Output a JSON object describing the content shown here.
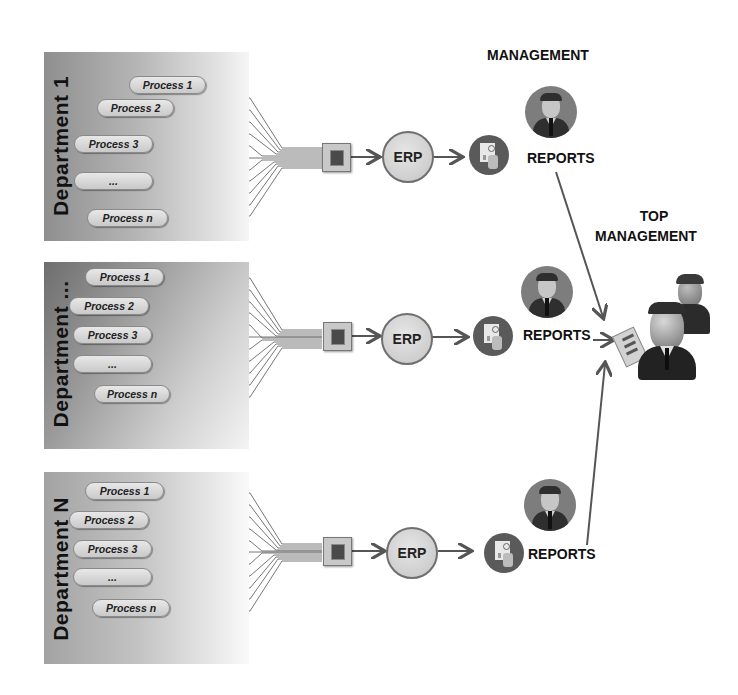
{
  "diagram": {
    "top_labels": {
      "management": "MANAGEMENT",
      "top_management_line1": "TOP",
      "top_management_line2": "MANAGEMENT"
    },
    "departments": [
      {
        "name": "Department  1",
        "processes": [
          "Process 1",
          "Process 2",
          "Process 3",
          "...",
          "Process n"
        ],
        "system": "ERP",
        "output": "REPORTS"
      },
      {
        "name": "Department ...",
        "processes": [
          "Process 1",
          "Process 2",
          "Process 3",
          "...",
          "Process n"
        ],
        "system": "ERP",
        "output": "REPORTS"
      },
      {
        "name": "Department  N",
        "processes": [
          "Process 1",
          "Process 2",
          "Process 3",
          "...",
          "Process n"
        ],
        "system": "ERP",
        "output": "REPORTS"
      }
    ],
    "colors": {
      "arrow": "#555555",
      "wire": "#6a6a6a",
      "text": "#111111"
    }
  }
}
